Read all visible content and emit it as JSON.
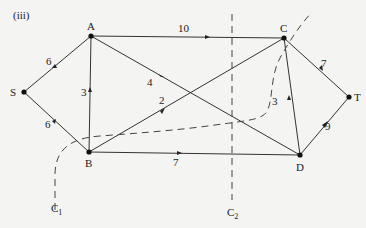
{
  "figure_label": "(iii)",
  "nodes": [
    {
      "id": "S",
      "label": "S",
      "x": 24,
      "y": 92
    },
    {
      "id": "A",
      "label": "A",
      "x": 91,
      "y": 36
    },
    {
      "id": "B",
      "label": "B",
      "x": 89,
      "y": 152
    },
    {
      "id": "C",
      "label": "C",
      "x": 284,
      "y": 38
    },
    {
      "id": "D",
      "label": "D",
      "x": 300,
      "y": 155
    },
    {
      "id": "T",
      "label": "T",
      "x": 349,
      "y": 97
    }
  ],
  "edges": [
    {
      "from": "S",
      "to": "A",
      "capacity": "6"
    },
    {
      "from": "S",
      "to": "B",
      "capacity": "6"
    },
    {
      "from": "B",
      "to": "A",
      "capacity": "3"
    },
    {
      "from": "A",
      "to": "C",
      "capacity": "10"
    },
    {
      "from": "A",
      "to": "D",
      "capacity": "4"
    },
    {
      "from": "B",
      "to": "C",
      "capacity": "2"
    },
    {
      "from": "B",
      "to": "D",
      "capacity": "7"
    },
    {
      "from": "D",
      "to": "C",
      "capacity": "3"
    },
    {
      "from": "C",
      "to": "T",
      "capacity": "7"
    },
    {
      "from": "D",
      "to": "T",
      "capacity": "9"
    }
  ],
  "cuts": [
    {
      "id": "C1",
      "label_main": "C",
      "label_sub": "1"
    },
    {
      "id": "C2",
      "label_main": "C",
      "label_sub": "2"
    }
  ]
}
